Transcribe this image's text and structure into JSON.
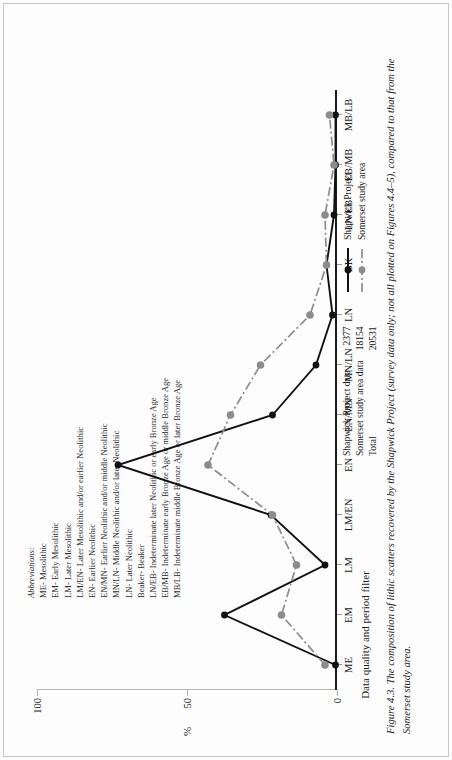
{
  "figure": {
    "caption": "Figure 4.3. The composition of lithic scatters recovered by the Shapwick Project (survey data only; not all plotted on Figures 4.4–5), compared to that from the Somerset study area."
  },
  "chart_data": {
    "type": "line",
    "title": "",
    "xlabel": "Data quality and period filter",
    "ylabel": "%",
    "ylim": [
      0,
      100
    ],
    "yticks": [
      0,
      50,
      100
    ],
    "ytick_labels": [
      "0",
      "50",
      "100"
    ],
    "grid": false,
    "legend_position": "below-right",
    "categories": [
      "ME",
      "EM",
      "LM",
      "LM/EN",
      "EN",
      "EN/MN",
      "MN/LN",
      "LN",
      "BK",
      "LN/EB",
      "EB/MB",
      "MB/LB"
    ],
    "series": [
      {
        "name": "Shapwick Project",
        "color": "#111111",
        "style": "solid",
        "marker": "filled-circle",
        "values": [
          0.5,
          37.5,
          4.0,
          22.0,
          73.0,
          21.5,
          7.0,
          1.5,
          3.5,
          1.0,
          0.5,
          0.5
        ]
      },
      {
        "name": "Somerset study area",
        "color": "#8c8c8c",
        "style": "dash-dot",
        "marker": "filled-circle",
        "values": [
          4.0,
          18.5,
          13.5,
          21.5,
          43.0,
          35.5,
          25.5,
          9.0,
          3.5,
          4.0,
          1.0,
          2.5
        ]
      }
    ]
  },
  "abbreviations": {
    "heading": "Abbreviations:",
    "items": [
      "ME- Mesolithic",
      "EM- Early Mesolithic",
      "LM- Later Mesolithic",
      "LM/EN- Later Mesolithic and/or earlier Neolithic",
      "EN- Earlier Neolithic",
      "EN/MN- Earlier Neolithic and/or middle Neolithic",
      "MN/LN- Middle Neolithic and/or later Neolithic",
      "LN- Later Neolithic",
      "Beaker- Beaker",
      "LN/EB- Indeterminate later Neolithic or early Bronze Age",
      "EB/MB- Indeterminate early Bronze Age or middle Bronze Age",
      "MB/LB- Indeterminate middle Bronze Age or later Bronze Age"
    ]
  },
  "data_table": {
    "rows": [
      {
        "label": "Shapwick Project data",
        "value": "2377"
      },
      {
        "label": "Somerset study area data",
        "value": "18154"
      },
      {
        "label": "Total",
        "value": "20531"
      }
    ]
  },
  "legend": {
    "entries": [
      {
        "label": "Shapwick Project",
        "color": "#111111",
        "style": "solid"
      },
      {
        "label": "Somerset study area",
        "color": "#8c8c8c",
        "style": "dash-dot"
      }
    ]
  }
}
